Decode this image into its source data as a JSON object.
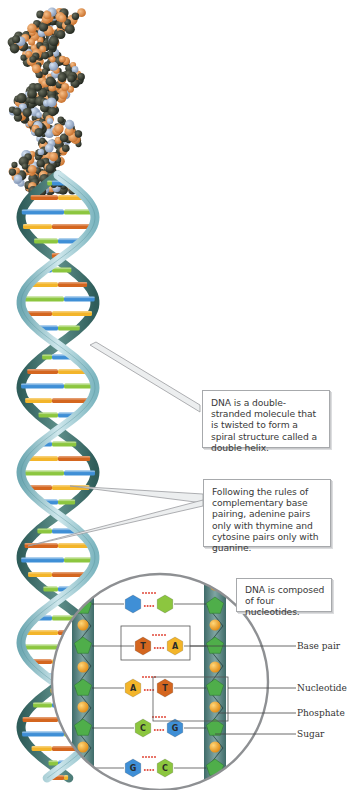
{
  "figure": {
    "model_label": "space-filling-model",
    "callouts": [
      {
        "id": "double-helix",
        "text": "DNA is a double-stranded molecule that is twisted to form a spiral structure called a double helix."
      },
      {
        "id": "base-pairing",
        "text": "Following the rules of complementary base pairing, adenine pairs only with thymine and cytosine pairs only with guanine."
      },
      {
        "id": "nucleotides",
        "text": "DNA is composed of four nucleotides."
      }
    ],
    "labels": {
      "base_pair": "Base pair",
      "nucleotide": "Nucleotide",
      "phosphate": "Phosphate",
      "sugar": "Sugar"
    },
    "base_pairs": [
      {
        "left": "",
        "right": "",
        "left_color": "blue",
        "right_color": "green"
      },
      {
        "left": "T",
        "right": "A",
        "left_color": "orange",
        "right_color": "yellow"
      },
      {
        "left": "A",
        "right": "T",
        "left_color": "yellow",
        "right_color": "orange"
      },
      {
        "left": "C",
        "right": "G",
        "left_color": "green",
        "right_color": "blue"
      },
      {
        "left": "G",
        "right": "C",
        "left_color": "blue",
        "right_color": "green"
      }
    ],
    "colors": {
      "adenine": "#f3b52a",
      "thymine": "#d4661f",
      "cytosine": "#8cc63f",
      "guanine": "#3f8fd6",
      "backbone": "#9ccbd6",
      "backbone_dark": "#3d6f6c",
      "sugar": "#4fae4a",
      "phosphate": "#f0a428",
      "hbond": "#e0483a",
      "callout_border": "#a7a9ac"
    }
  }
}
